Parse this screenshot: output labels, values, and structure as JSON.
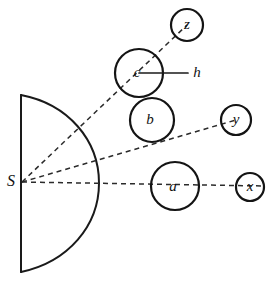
{
  "figure": {
    "background_color": "#ffffff",
    "stroke_color": "#141414",
    "dash_color": "#2b2b2b",
    "width": 272,
    "height": 284
  },
  "labels": {
    "source": "S",
    "height_marker": "h",
    "circle_a": "a",
    "circle_b": "b",
    "circle_c": "c",
    "circle_x": "x",
    "circle_y": "y",
    "circle_z": "z"
  },
  "geometry": {
    "source_point": {
      "x": 22,
      "y": 182
    },
    "mirror": {
      "chord_x": 21,
      "chord_top_y": 95,
      "chord_bottom_y": 272,
      "apex_x": 99,
      "apex_y": 183
    },
    "circles": [
      {
        "name": "a",
        "cx": 175,
        "cy": 186,
        "r": 24
      },
      {
        "name": "b",
        "cx": 152,
        "cy": 120,
        "r": 22
      },
      {
        "name": "c",
        "cx": 139,
        "cy": 73,
        "r": 24
      },
      {
        "name": "x",
        "cx": 250,
        "cy": 187,
        "r": 14
      },
      {
        "name": "y",
        "cx": 236,
        "cy": 120,
        "r": 15
      },
      {
        "name": "z",
        "cx": 187,
        "cy": 25,
        "r": 16
      }
    ],
    "rays": [
      {
        "name": "ray-s-to-z",
        "x1": 22,
        "y1": 182,
        "x2": 187,
        "y2": 25
      },
      {
        "name": "ray-s-to-y",
        "x1": 22,
        "y1": 182,
        "x2": 236,
        "y2": 120
      },
      {
        "name": "ray-s-to-x",
        "x1": 22,
        "y1": 182,
        "x2": 264,
        "y2": 186
      }
    ],
    "height_line": {
      "x1": 139,
      "y1": 73,
      "x2": 188,
      "y2": 73
    }
  }
}
